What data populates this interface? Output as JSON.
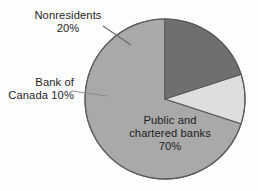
{
  "chart_data": {
    "type": "pie",
    "title": "",
    "subtitle": "",
    "xlabel": "",
    "ylabel": "",
    "legend_position": "none",
    "grid": false,
    "units": "percent",
    "start_angle_deg": 0,
    "direction": "counterclockwise",
    "categories": [
      "Public and chartered banks",
      "Bank of Canada",
      "Nonresidents"
    ],
    "values": [
      70,
      10,
      20
    ],
    "slices": [
      {
        "name": "Public and chartered banks",
        "label_line1": "Public and",
        "label_line2": "chartered banks",
        "value_label": "70%",
        "value": 70,
        "color": "#a9a9a9",
        "label_placement": "inside"
      },
      {
        "name": "Bank of Canada",
        "label_line1": "Bank of",
        "label_line2": "Canada 10%",
        "value_label": "10%",
        "value": 10,
        "color": "#dedede",
        "label_placement": "outside-left"
      },
      {
        "name": "Nonresidents",
        "label_line1": "Nonresidents",
        "label_line2": "20%",
        "value_label": "20%",
        "value": 20,
        "color": "#6f6f6f",
        "label_placement": "outside-upper-left"
      }
    ],
    "geometry": {
      "center_x": 165,
      "center_y": 99,
      "radius": 80
    },
    "colors": {
      "background": "#fefefe",
      "outline": "#5a5a5a",
      "text": "#1d1d1d",
      "leader_line": "#7a7a7a"
    }
  }
}
